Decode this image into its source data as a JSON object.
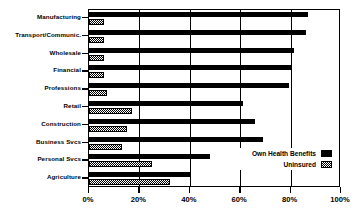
{
  "chart_data": {
    "type": "bar",
    "orientation": "horizontal",
    "title": "",
    "subtitle": "",
    "xlabel": "",
    "ylabel": "",
    "xlim": [
      0,
      100
    ],
    "xticks": [
      0,
      20,
      40,
      60,
      80,
      100
    ],
    "xtick_labels": [
      "0%",
      "20%",
      "40%",
      "60%",
      "80%",
      "100%"
    ],
    "grid": true,
    "grid_axis": "x",
    "legend_position": "inside-lower-right",
    "categories": [
      "Manufacturing",
      "Transport/Communic.",
      "Wholesale",
      "Financial",
      "Professions",
      "Retail",
      "Construction",
      "Business Svcs",
      "Personal Svcs",
      "Agriculture"
    ],
    "series": [
      {
        "name": "Own Health Benefits",
        "pattern": "solid-black",
        "color": "#000000",
        "values": [
          87,
          86,
          81.5,
          80,
          79.5,
          61,
          66,
          69,
          48,
          40.5
        ]
      },
      {
        "name": "Uninsured",
        "pattern": "checkered-hatch",
        "color": "#000000",
        "values": [
          6,
          6,
          6,
          6,
          7,
          17,
          15,
          13,
          25,
          32
        ]
      }
    ]
  },
  "legend": {
    "entries": [
      {
        "label": "Own Health Benefits",
        "swatch": "solid-black-swatch"
      },
      {
        "label": "Uninsured",
        "swatch": "hatched-swatch"
      }
    ]
  }
}
